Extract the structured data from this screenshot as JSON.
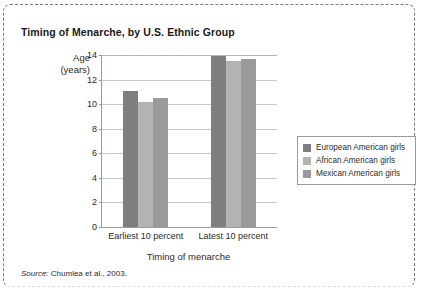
{
  "figure": {
    "title": "Timing of Menarche, by U.S. Ethnic Group",
    "source_lead": "Source:",
    "source_text": " Chumlea et al., 2003."
  },
  "chart_data": {
    "type": "bar",
    "title": "Timing of Menarche, by U.S. Ethnic Group",
    "xlabel": "Timing of menarche",
    "ylabel": "Age (years)",
    "ylabel_line1": "Age",
    "ylabel_line2": "(years)",
    "categories": [
      "Earliest 10 percent",
      "Latest 10 percent"
    ],
    "ylim": [
      0,
      14
    ],
    "yticks": [
      0,
      2,
      4,
      6,
      8,
      10,
      12,
      14
    ],
    "ytick_labels": [
      "0",
      "2",
      "4",
      "6",
      "8",
      "10",
      "12",
      "14"
    ],
    "grid": true,
    "legend_position": "right",
    "series": [
      {
        "name": "European American girls",
        "color": "#7e7e7e",
        "values": [
          11.1,
          13.9
        ]
      },
      {
        "name": "African American girls",
        "color": "#b3b3b3",
        "values": [
          10.2,
          13.5
        ]
      },
      {
        "name": "Mexican American girls",
        "color": "#9a9a9a",
        "values": [
          10.5,
          13.7
        ]
      }
    ]
  }
}
